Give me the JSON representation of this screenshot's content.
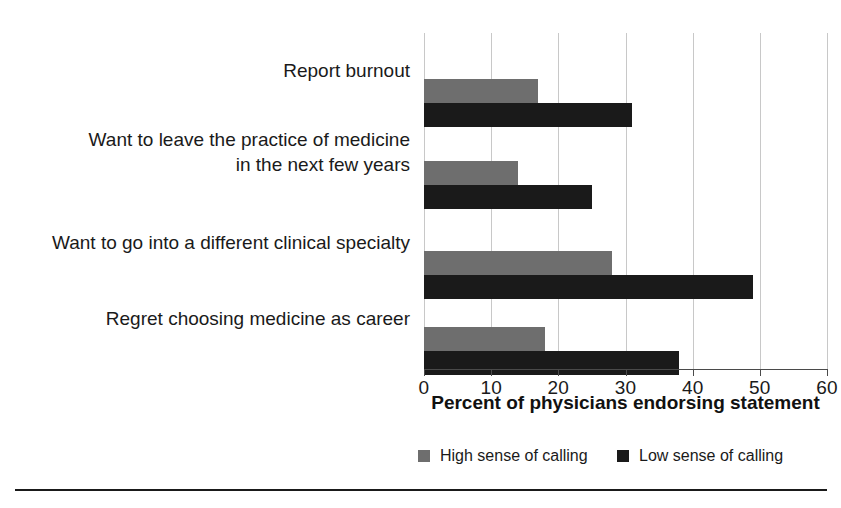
{
  "chart_data": {
    "type": "bar",
    "orientation": "horizontal",
    "title": "",
    "xlabel": "Percent of physicians endorsing statement",
    "ylabel": "",
    "xlim": [
      0,
      60
    ],
    "xticks": [
      0,
      10,
      20,
      30,
      40,
      50,
      60
    ],
    "xtick_labels": [
      "0",
      "10",
      "20",
      "30",
      "40",
      "50",
      "60"
    ],
    "grid": true,
    "grid_axis": "x",
    "legend_position": "bottom",
    "categories": [
      "Report burnout",
      "Want to leave the practice of medicine in the next few years",
      "Want to go into a different clinical specialty",
      "Regret choosing medicine as career"
    ],
    "category_lines": [
      [
        "Report burnout"
      ],
      [
        "Want to leave the practice of medicine",
        "in the next few years"
      ],
      [
        "Want to go into a different clinical specialty"
      ],
      [
        "Regret choosing medicine as career"
      ]
    ],
    "series": [
      {
        "name": "High sense of calling",
        "color": "#6e6e6e",
        "values": [
          17,
          14,
          28,
          18
        ]
      },
      {
        "name": "Low sense of calling",
        "color": "#1a1a1a",
        "values": [
          31,
          25,
          49,
          38
        ]
      }
    ]
  },
  "legend": {
    "items": [
      {
        "label": "High sense of calling",
        "color": "#6e6e6e"
      },
      {
        "label": "Low sense of calling",
        "color": "#1a1a1a"
      }
    ]
  },
  "axis": {
    "title": "Percent of physicians endorsing statement"
  }
}
